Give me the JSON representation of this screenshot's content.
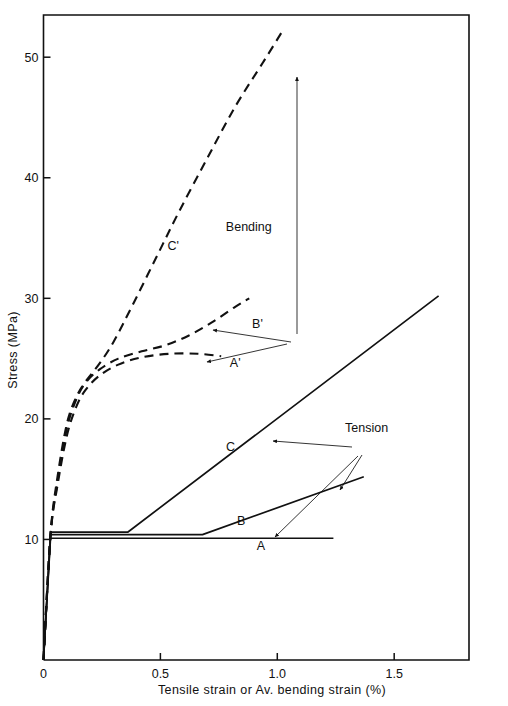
{
  "chart_data": {
    "type": "line",
    "title": "",
    "xlabel": "Tensile strain or  Av. bending strain (%)",
    "ylabel": "Stress (MPa)",
    "xlim": [
      0,
      1.82
    ],
    "ylim": [
      0,
      53.5
    ],
    "grid": false,
    "legend_position": "none",
    "x_ticks": [
      {
        "value": 0,
        "label": "0"
      },
      {
        "value": 0.5,
        "label": "0.5"
      },
      {
        "value": 1.0,
        "label": "1.0"
      },
      {
        "value": 1.5,
        "label": "1.5"
      }
    ],
    "y_ticks": [
      {
        "value": 10,
        "label": "10"
      },
      {
        "value": 20,
        "label": "20"
      },
      {
        "value": 30,
        "label": "30"
      },
      {
        "value": 40,
        "label": "40"
      },
      {
        "value": 50,
        "label": "50"
      }
    ],
    "series": [
      {
        "name": "A",
        "style": "solid",
        "group": "Tension",
        "points": [
          [
            0.0,
            0.0
          ],
          [
            0.03,
            10.1
          ],
          [
            1.24,
            10.1
          ]
        ]
      },
      {
        "name": "B",
        "style": "solid",
        "group": "Tension",
        "points": [
          [
            0.0,
            0.0
          ],
          [
            0.03,
            10.4
          ],
          [
            0.68,
            10.4
          ],
          [
            1.37,
            15.2
          ]
        ]
      },
      {
        "name": "C",
        "style": "solid",
        "group": "Tension",
        "points": [
          [
            0.0,
            0.0
          ],
          [
            0.03,
            10.6
          ],
          [
            0.36,
            10.6
          ],
          [
            1.69,
            30.2
          ]
        ]
      },
      {
        "name": "A'",
        "style": "dashed",
        "group": "Bending",
        "points": [
          [
            0.0,
            0.0
          ],
          [
            0.03,
            10.3
          ],
          [
            0.06,
            14.5
          ],
          [
            0.1,
            18.6
          ],
          [
            0.14,
            21.0
          ],
          [
            0.18,
            22.4
          ],
          [
            0.24,
            23.6
          ],
          [
            0.32,
            24.5
          ],
          [
            0.42,
            25.1
          ],
          [
            0.54,
            25.4
          ],
          [
            0.66,
            25.4
          ],
          [
            0.76,
            25.2
          ]
        ]
      },
      {
        "name": "B'",
        "style": "dashed",
        "group": "Bending",
        "points": [
          [
            0.0,
            0.0
          ],
          [
            0.03,
            10.3
          ],
          [
            0.06,
            14.8
          ],
          [
            0.1,
            19.2
          ],
          [
            0.14,
            21.6
          ],
          [
            0.18,
            23.0
          ],
          [
            0.24,
            24.1
          ],
          [
            0.32,
            25.0
          ],
          [
            0.42,
            25.6
          ],
          [
            0.52,
            26.1
          ],
          [
            0.62,
            26.9
          ],
          [
            0.72,
            28.0
          ],
          [
            0.82,
            29.3
          ],
          [
            0.88,
            30.0
          ]
        ]
      },
      {
        "name": "C'",
        "style": "dashed",
        "group": "Bending",
        "points": [
          [
            0.0,
            0.0
          ],
          [
            0.03,
            10.4
          ],
          [
            0.06,
            15.2
          ],
          [
            0.1,
            19.6
          ],
          [
            0.14,
            21.8
          ],
          [
            0.18,
            23.1
          ],
          [
            0.24,
            24.6
          ],
          [
            0.3,
            26.4
          ],
          [
            0.38,
            29.4
          ],
          [
            0.48,
            33.3
          ],
          [
            0.58,
            37.2
          ],
          [
            0.7,
            41.6
          ],
          [
            0.82,
            45.9
          ],
          [
            0.94,
            49.6
          ],
          [
            1.02,
            52.1
          ]
        ]
      }
    ],
    "curve_labels": [
      {
        "text": "A",
        "x": 0.93,
        "y": 9.1
      },
      {
        "text": "B",
        "x": 0.845,
        "y": 11.2
      },
      {
        "text": "C",
        "x": 0.8,
        "y": 17.3
      },
      {
        "text": "A'",
        "x": 0.82,
        "y": 24.3
      },
      {
        "text": "B'",
        "x": 0.915,
        "y": 27.5
      },
      {
        "text": "C'",
        "x": 0.555,
        "y": 34.0
      }
    ],
    "annotations": [
      {
        "text": "Bending",
        "x": 0.78,
        "y": 35.6
      },
      {
        "text": "Tension",
        "x": 1.29,
        "y": 18.9
      }
    ]
  }
}
